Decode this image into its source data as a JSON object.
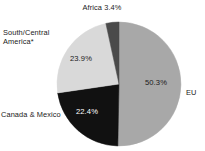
{
  "chart_data": {
    "type": "pie",
    "title": "",
    "subtitle": "",
    "xlabel": "",
    "ylabel": "",
    "legend_position": "none",
    "grid": false,
    "categories": [
      "EU",
      "Canada & Mexico",
      "South/Central America*",
      "Africa"
    ],
    "values": [
      50.3,
      22.4,
      23.9,
      3.4
    ],
    "slices": [
      {
        "label": "EU",
        "value": 50.3,
        "value_label": "50.3%",
        "color": "#a8a8a8",
        "label_placement": "outside-right",
        "value_placement": "inside"
      },
      {
        "label": "Canada & Mexico",
        "value": 22.4,
        "value_label": "22.4%",
        "color": "#111111",
        "label_placement": "outside-left",
        "value_placement": "inside"
      },
      {
        "label": "South/Central America*",
        "value": 23.9,
        "value_label": "23.9%",
        "color": "#d9d9d9",
        "label_placement": "outside-left",
        "value_placement": "inside"
      },
      {
        "label": "Africa",
        "value": 3.4,
        "value_label": "3.4%",
        "color": "#4a4a4a",
        "label_placement": "outside-top",
        "value_placement": "outside"
      }
    ],
    "start_angle_deg": 0,
    "direction": "clockwise",
    "total": 100.0,
    "units": "percent"
  },
  "labels": {
    "africa": "Africa 3.4%",
    "south_central_america": "South/Central\nAmerica*",
    "canada_mexico": "Canada & Mexico",
    "eu": "EU",
    "value_eu": "50.3%",
    "value_south_central": "23.9%",
    "value_canada_mexico": "22.4%"
  },
  "geometry": {
    "center_x": 119,
    "center_y": 84,
    "radius": 62
  },
  "colors": {
    "background": "#ffffff",
    "eu_slice": "#a8a8a8",
    "canada_mexico_slice": "#111111",
    "south_central_slice": "#d9d9d9",
    "africa_slice": "#4a4a4a",
    "text": "#1a1a1a",
    "inverse_text": "#ffffff"
  }
}
